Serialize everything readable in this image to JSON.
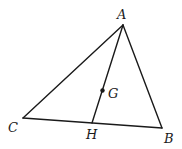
{
  "diagram": {
    "type": "geometry-triangle",
    "points": {
      "A": {
        "label": "A",
        "x": 123,
        "y": 25
      },
      "B": {
        "label": "B",
        "x": 162,
        "y": 128
      },
      "C": {
        "label": "C",
        "x": 23,
        "y": 118
      },
      "H": {
        "label": "H",
        "x": 92,
        "y": 123
      },
      "G": {
        "label": "G",
        "x": 102,
        "y": 90
      }
    },
    "segments": [
      "AB",
      "BC",
      "CA",
      "AH"
    ],
    "labels": {
      "A": "A",
      "B": "B",
      "C": "C",
      "H": "H",
      "G": "G"
    },
    "colors": {
      "stroke": "#1a1a1a",
      "background": "#ffffff"
    }
  }
}
